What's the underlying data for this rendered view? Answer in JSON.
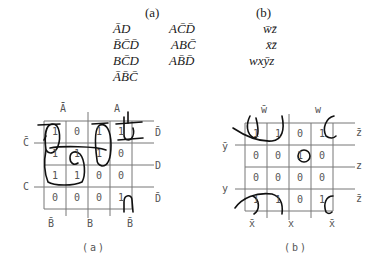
{
  "top": {
    "a": {
      "label": "(a)",
      "col1": [
        "ĀD",
        "B̄C̄D̄",
        "BC̄D",
        "ĀB̄C̄"
      ],
      "col2": [
        "AC̄D̄",
        "ABC̄",
        "AB̄D̄"
      ]
    },
    "b": {
      "label": "(b)",
      "terms": [
        "w̄z̄",
        "x̄z̄",
        "wxȳz"
      ]
    }
  },
  "kmap_a": {
    "caption": "(a)",
    "top_labels": [
      "Ā",
      "A"
    ],
    "left_labels": [
      "C̄",
      "C"
    ],
    "right_labels": [
      "D̄",
      "D",
      "D̄"
    ],
    "bottom_labels": [
      "B̄",
      "B",
      "B̄"
    ],
    "cells": [
      [
        "1",
        "0",
        "1",
        "1"
      ],
      [
        "1",
        "1",
        "1",
        "0"
      ],
      [
        "1",
        "1",
        "0",
        "0"
      ],
      [
        "0",
        "0",
        "0",
        "1"
      ]
    ]
  },
  "kmap_b": {
    "caption": "(b)",
    "top_labels": [
      "w̄",
      "w"
    ],
    "left_labels": [
      "ȳ",
      "y"
    ],
    "right_labels": [
      "z̄",
      "z",
      "z̄"
    ],
    "bottom_labels": [
      "x̄",
      "x",
      "x̄"
    ],
    "cells": [
      [
        "1",
        "1",
        "0",
        "1"
      ],
      [
        "0",
        "0",
        "1",
        "0"
      ],
      [
        "0",
        "0",
        "0",
        "0"
      ],
      [
        "1",
        "1",
        "0",
        "1"
      ]
    ]
  }
}
